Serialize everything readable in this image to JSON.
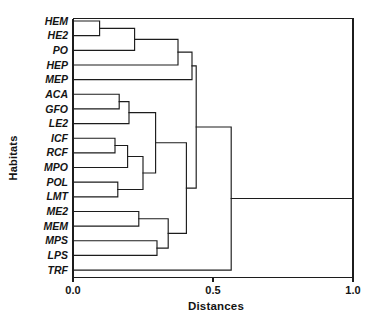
{
  "chart_data": {
    "type": "dendrogram",
    "title": "",
    "xlabel": "Distances",
    "ylabel": "Habitats",
    "xlim": [
      0.0,
      1.0
    ],
    "xticks": [
      0.0,
      0.5,
      1.0
    ],
    "xtick_labels": [
      "0.0",
      "0.5",
      "1.0"
    ],
    "grid": false,
    "legend": null,
    "leaf_order": [
      "HEM",
      "HE2",
      "PO",
      "HEP",
      "MEP",
      "ACA",
      "GFO",
      "LE2",
      "ICF",
      "RCF",
      "MPO",
      "POL",
      "LMT",
      "ME2",
      "MEM",
      "MPS",
      "LPS",
      "TRF"
    ],
    "merges": [
      {
        "id": "n1",
        "left": "HEM",
        "right": "HE2",
        "distance": 0.095
      },
      {
        "id": "n2",
        "left": "n1",
        "right": "PO",
        "distance": 0.22
      },
      {
        "id": "n3",
        "left": "n2",
        "right": "HEP",
        "distance": 0.375
      },
      {
        "id": "n4",
        "left": "n3",
        "right": "MEP",
        "distance": 0.425
      },
      {
        "id": "n5",
        "left": "ACA",
        "right": "GFO",
        "distance": 0.165
      },
      {
        "id": "n6",
        "left": "n5",
        "right": "LE2",
        "distance": 0.2
      },
      {
        "id": "n7",
        "left": "ICF",
        "right": "RCF",
        "distance": 0.15
      },
      {
        "id": "n8",
        "left": "n7",
        "right": "MPO",
        "distance": 0.195
      },
      {
        "id": "n9",
        "left": "POL",
        "right": "LMT",
        "distance": 0.16
      },
      {
        "id": "n10",
        "left": "n8",
        "right": "n9",
        "distance": 0.25
      },
      {
        "id": "n11",
        "left": "n6",
        "right": "n10",
        "distance": 0.295
      },
      {
        "id": "n12",
        "left": "ME2",
        "right": "MEM",
        "distance": 0.235
      },
      {
        "id": "n13",
        "left": "MPS",
        "right": "LPS",
        "distance": 0.3
      },
      {
        "id": "n14",
        "left": "n12",
        "right": "n13",
        "distance": 0.34
      },
      {
        "id": "n15",
        "left": "n11",
        "right": "n14",
        "distance": 0.405
      },
      {
        "id": "n16",
        "left": "n4",
        "right": "n15",
        "distance": 0.44
      },
      {
        "id": "n17",
        "left": "n16",
        "right": "TRF",
        "distance": 0.565
      }
    ]
  }
}
